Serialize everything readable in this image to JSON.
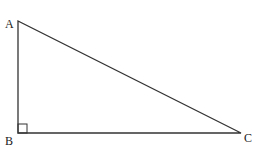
{
  "diagram": {
    "type": "right-triangle",
    "stroke_color": "#333333",
    "vertices": [
      {
        "label": "A",
        "x": 18,
        "y": 21
      },
      {
        "label": "B",
        "x": 18,
        "y": 133
      },
      {
        "label": "C",
        "x": 241,
        "y": 133
      }
    ],
    "right_angle_at": "B"
  }
}
